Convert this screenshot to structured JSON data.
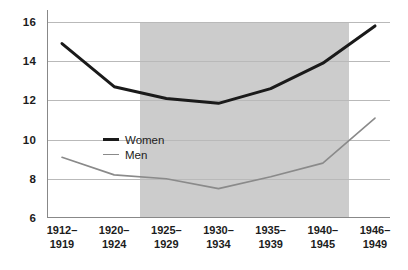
{
  "chart_data": {
    "type": "line",
    "title": "",
    "subtitle": "",
    "xlabel": "",
    "ylabel": "",
    "categories": [
      "1912–\n1919",
      "1920–\n1924",
      "1925–\n1929",
      "1930–\n1934",
      "1935–\n1939",
      "1940–\n1945",
      "1946–\n1949"
    ],
    "category_lines": [
      [
        "1912–",
        "1919"
      ],
      [
        "1920–",
        "1924"
      ],
      [
        "1925–",
        "1929"
      ],
      [
        "1930–",
        "1934"
      ],
      [
        "1935–",
        "1939"
      ],
      [
        "1940–",
        "1945"
      ],
      [
        "1946–",
        "1949"
      ]
    ],
    "series": [
      {
        "name": "Women",
        "values": [
          14.9,
          12.7,
          12.1,
          11.85,
          12.6,
          13.9,
          15.8
        ],
        "color": "#1a1a1a",
        "width": 3
      },
      {
        "name": "Men",
        "values": [
          9.1,
          8.2,
          8.0,
          7.5,
          8.1,
          8.8,
          11.1
        ],
        "color": "#8a8a8a",
        "width": 1.6
      }
    ],
    "ylim": [
      6,
      16
    ],
    "yticks": [
      6,
      8,
      10,
      12,
      14,
      16
    ],
    "ytick_labels": [
      "6",
      "8",
      "10",
      "12",
      "14",
      "16"
    ],
    "grid": true,
    "grid_color": "#b9b9b9",
    "legend_position": "inside-left",
    "shaded_region": {
      "from_category_index": 2,
      "to_category_index": 5,
      "color": "#cccccc"
    },
    "background": "#ffffff"
  },
  "legend": {
    "entries": [
      {
        "label": "Women"
      },
      {
        "label": "Men"
      }
    ]
  }
}
